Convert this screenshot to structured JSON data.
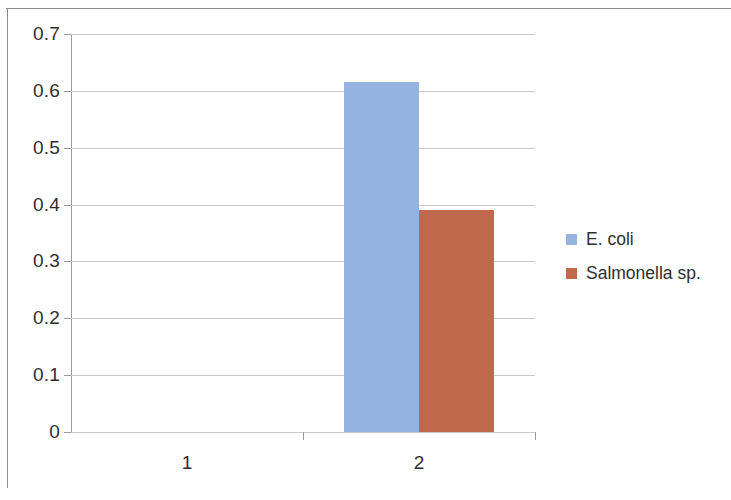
{
  "chart_data": {
    "type": "bar",
    "title": "",
    "subtitle": "",
    "xlabel": "",
    "ylabel": "",
    "categories": [
      "1",
      "2"
    ],
    "series": [
      {
        "name": "E. coli",
        "color": "#95b3e0",
        "values": [
          0,
          0.615
        ]
      },
      {
        "name": "Salmonella sp.",
        "color": "#c0694d",
        "values": [
          0,
          0.39
        ]
      }
    ],
    "ylim": [
      0,
      0.7
    ],
    "ytick_labels": [
      "0.7",
      "0.6",
      "0.5",
      "0.4",
      "0.3",
      "0.2",
      "0.1",
      "0"
    ],
    "ytick_values": [
      0.7,
      0.6,
      0.5,
      0.4,
      0.3,
      0.2,
      0.1,
      0
    ],
    "grid": true,
    "grid_axis": "y",
    "legend_position": "right",
    "legend_entries": [
      {
        "label": "E. coli",
        "color": "#95b3e0"
      },
      {
        "label": "Salmonella sp.",
        "color": "#c0694d"
      }
    ]
  }
}
